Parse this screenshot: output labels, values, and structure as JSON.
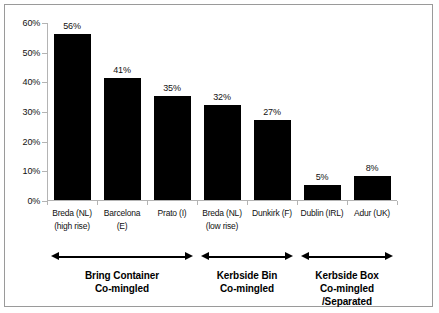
{
  "chart_data": {
    "type": "bar",
    "title": "",
    "subtitle": "",
    "xlabel": "",
    "ylabel": "",
    "ylim": [
      0,
      60
    ],
    "ytick_labels": [
      "0%",
      "10%",
      "20%",
      "30%",
      "40%",
      "50%",
      "60%"
    ],
    "ytick_values": [
      0,
      10,
      20,
      30,
      40,
      50,
      60
    ],
    "grid": false,
    "legend": "none",
    "bar_color": "#000000",
    "axis_color": "#b4b4b4",
    "categories": [
      "Breda (NL) (high rise)",
      "Barcelona (E)",
      "Prato (I)",
      "Breda (NL) (low rise)",
      "Dunkirk (F)",
      "Dublin (IRL)",
      "Adur (UK)"
    ],
    "values": [
      56,
      41,
      35,
      32,
      27,
      5,
      8
    ],
    "value_labels": [
      "56%",
      "41%",
      "35%",
      "32%",
      "27%",
      "5%",
      "8%"
    ],
    "category_lines": [
      {
        "line1": "Breda (NL)",
        "line2": "(high rise)"
      },
      {
        "line1": "Barcelona",
        "line2": "(E)"
      },
      {
        "line1": "Prato (I)",
        "line2": ""
      },
      {
        "line1": "Breda (NL)",
        "line2": "(low rise)"
      },
      {
        "line1": "Dunkirk (F)",
        "line2": ""
      },
      {
        "line1": "Dublin  (IRL)",
        "line2": ""
      },
      {
        "line1": "Adur (UK)",
        "line2": ""
      }
    ],
    "annotations": [
      {
        "line1": "Bring  Container",
        "line2": "Co-mingled",
        "bars": [
          0,
          1,
          2
        ]
      },
      {
        "line1": "Kerbside Bin",
        "line2": "Co-mingled",
        "bars": [
          3,
          4
        ]
      },
      {
        "line1": "Kerbside Box",
        "line2": "Co-mingled /Separated",
        "bars": [
          5,
          6
        ]
      }
    ]
  }
}
